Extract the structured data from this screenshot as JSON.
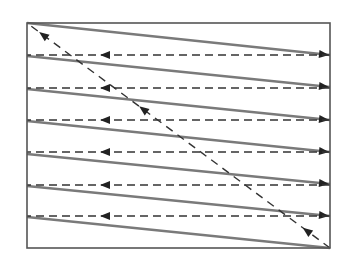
{
  "diagram": {
    "canvas": {
      "width": 350,
      "height": 270
    },
    "colors": {
      "background": "#ffffff",
      "frame": "#555555",
      "scan_line": "#7a7a7a",
      "retrace_line": "#333333",
      "arrow": "#222222"
    },
    "frame": {
      "x": 27,
      "y": 23,
      "width": 303,
      "height": 225
    },
    "scan_lines": [
      {
        "x1": 27,
        "y1": 23,
        "x2": 330,
        "y2": 55
      },
      {
        "x1": 27,
        "y1": 56,
        "x2": 330,
        "y2": 87
      },
      {
        "x1": 27,
        "y1": 89,
        "x2": 330,
        "y2": 120
      },
      {
        "x1": 27,
        "y1": 121,
        "x2": 330,
        "y2": 152
      },
      {
        "x1": 27,
        "y1": 154,
        "x2": 330,
        "y2": 184
      },
      {
        "x1": 27,
        "y1": 186,
        "x2": 330,
        "y2": 216
      },
      {
        "x1": 27,
        "y1": 217,
        "x2": 330,
        "y2": 248
      }
    ],
    "horizontal_retraces": [
      {
        "y": 55,
        "x_from": 330,
        "x_to": 27,
        "arrow_x": 100
      },
      {
        "y": 88,
        "x_from": 330,
        "x_to": 27,
        "arrow_x": 100
      },
      {
        "y": 120,
        "x_from": 330,
        "x_to": 27,
        "arrow_x": 100
      },
      {
        "y": 152,
        "x_from": 330,
        "x_to": 27,
        "arrow_x": 100
      },
      {
        "y": 185,
        "x_from": 330,
        "x_to": 27,
        "arrow_x": 100
      },
      {
        "y": 216,
        "x_from": 330,
        "x_to": 27,
        "arrow_x": 100
      }
    ],
    "vertical_retrace": {
      "x1": 330,
      "y1": 248,
      "x2": 27,
      "y2": 23,
      "arrow_positions": [
        0.09,
        0.63,
        0.96
      ]
    }
  }
}
